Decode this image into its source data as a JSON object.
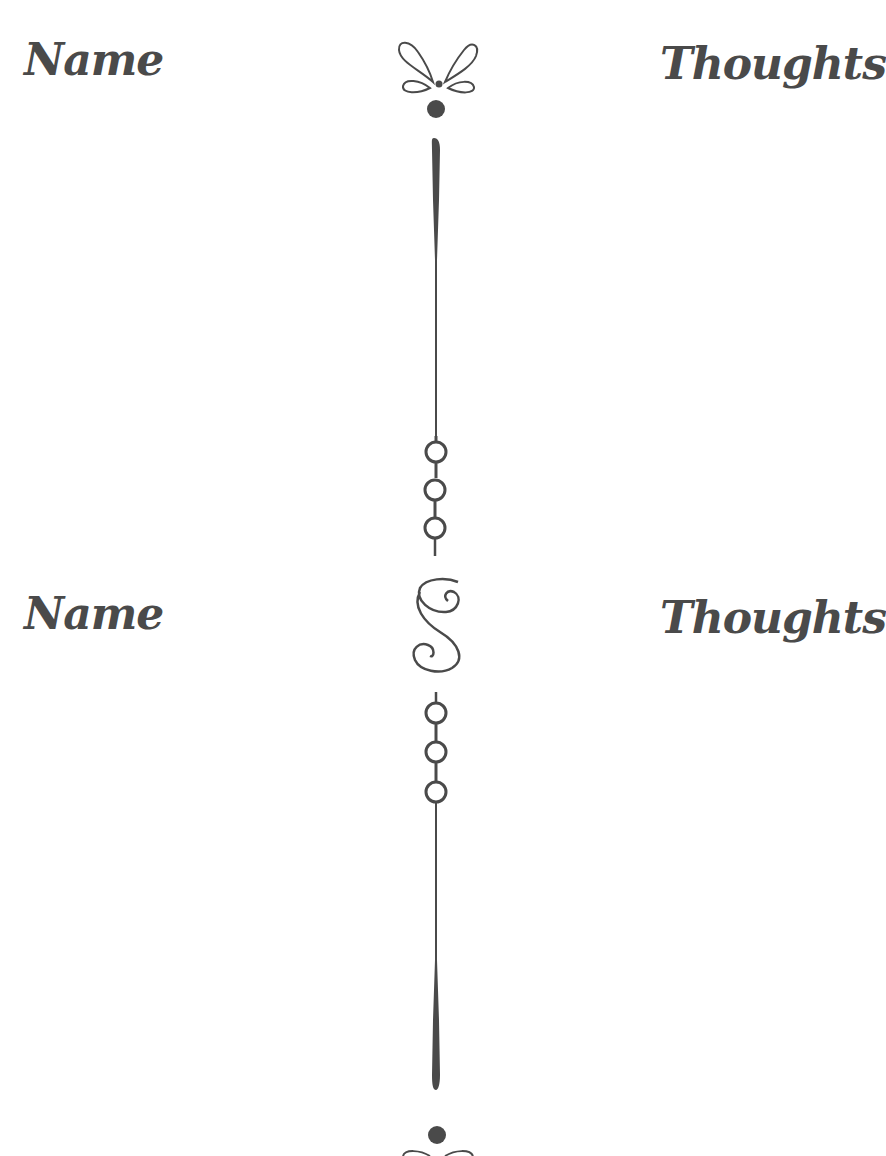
{
  "sections": [
    {
      "left_label": "Name",
      "right_label": "Thoughts",
      "top_ornament": "butterfly-loops-icon",
      "divider": "tapered-line-with-chain"
    },
    {
      "left_label": "Name",
      "right_label": "Thoughts",
      "top_ornament": "s-swirl-icon",
      "divider": "chain-with-tapered-line"
    }
  ],
  "colors": {
    "ink": "#4a4a4a",
    "background": "#ffffff"
  }
}
